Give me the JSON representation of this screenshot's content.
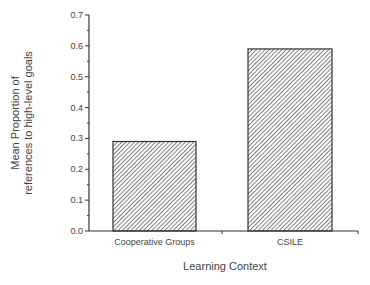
{
  "chart_data": {
    "type": "bar",
    "title": "",
    "xlabel": "Learning Context",
    "ylabel": [
      "Mean Proportion of",
      "references to high-level goals"
    ],
    "categories": [
      "Cooperative Groups",
      "CSILE"
    ],
    "values": [
      0.29,
      0.59
    ],
    "ylim": [
      0.0,
      0.7
    ],
    "yticks": [
      "0.0",
      "0.1",
      "0.2",
      "0.3",
      "0.4",
      "0.5",
      "0.6",
      "0.7"
    ],
    "grid": false,
    "legend": null,
    "bar_fill": "diagonal-hatch",
    "colors": {
      "axis": "#333333",
      "bar_edge": "#333333",
      "hatch": "#555555"
    }
  }
}
